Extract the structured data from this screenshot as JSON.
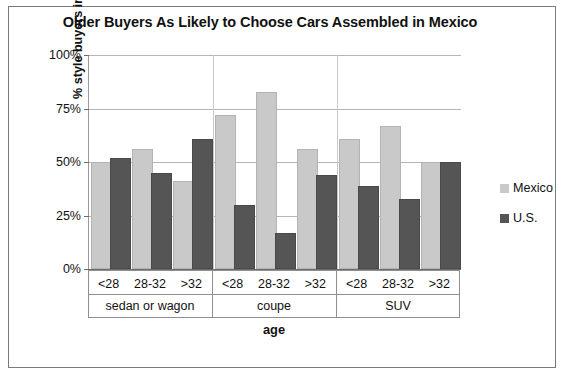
{
  "chart_data": {
    "type": "bar",
    "title": "Older Buyers As Likely to Choose Cars Assembled in Mexico",
    "xlabel": "age",
    "ylabel": "% style buyers in age x car type category",
    "ylim": [
      0,
      100
    ],
    "ytick_labels": [
      "100%",
      "75%",
      "50%",
      "25%",
      "0%"
    ],
    "ytick_values": [
      100,
      75,
      50,
      25,
      0
    ],
    "grid": true,
    "legend_position": "right",
    "categories": [
      "<28",
      "28-32",
      ">32",
      "<28",
      "28-32",
      ">32",
      "<28",
      "28-32",
      ">32"
    ],
    "group_labels": [
      "sedan or wagon",
      "coupe",
      "SUV"
    ],
    "series": [
      {
        "name": "Mexico",
        "color": "#c9c9c9",
        "values": [
          49,
          55,
          40,
          71,
          82,
          55,
          60,
          66,
          49
        ]
      },
      {
        "name": "U.S.",
        "color": "#555555",
        "values": [
          51,
          44,
          60,
          29,
          16,
          43,
          38,
          32,
          49
        ]
      }
    ]
  },
  "legend": {
    "items": [
      {
        "label": "Mexico",
        "color": "#c9c9c9"
      },
      {
        "label": "U.S.",
        "color": "#555555"
      }
    ]
  }
}
